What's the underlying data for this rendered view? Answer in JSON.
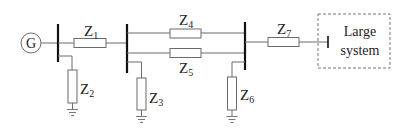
{
  "diagram": {
    "title": "",
    "generator": {
      "label": "G"
    },
    "impedances": [
      {
        "id": "Z1",
        "main": "Z",
        "sub": "1"
      },
      {
        "id": "Z2",
        "main": "Z",
        "sub": "2"
      },
      {
        "id": "Z3",
        "main": "Z",
        "sub": "3"
      },
      {
        "id": "Z4",
        "main": "Z",
        "sub": "4"
      },
      {
        "id": "Z5",
        "main": "Z",
        "sub": "5"
      },
      {
        "id": "Z6",
        "main": "Z",
        "sub": "6"
      },
      {
        "id": "Z7",
        "main": "Z",
        "sub": "7"
      }
    ],
    "large_system": {
      "line1": "Large",
      "line2": "system"
    },
    "colors": {
      "wire": "#6b6b6b",
      "bus": "#111111",
      "text": "#222222"
    }
  }
}
